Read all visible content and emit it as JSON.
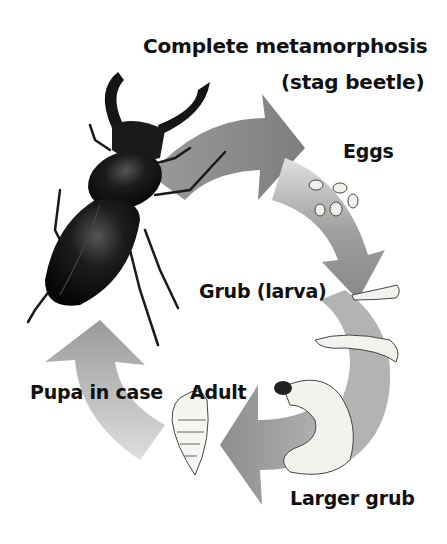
{
  "diagram": {
    "title_line1": "Complete metamorphosis",
    "title_line2": "(stag beetle)",
    "stages": [
      {
        "id": "eggs",
        "label": "Eggs"
      },
      {
        "id": "grub",
        "label": "Grub (larva)"
      },
      {
        "id": "larger-grub",
        "label": "Larger grub"
      },
      {
        "id": "pupa",
        "label": "Pupa in case"
      },
      {
        "id": "adult",
        "label": "Adult"
      }
    ],
    "colors": {
      "arrow": "#8a8a8a",
      "arrow_light": "#d6d6d6",
      "beetle": "#151515",
      "text": "#111111",
      "background": "#ffffff"
    }
  }
}
